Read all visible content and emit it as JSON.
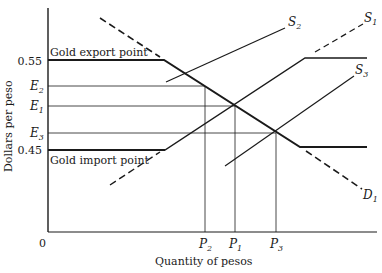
{
  "diagram": {
    "y_axis_label": "Dollars per peso",
    "x_axis_label": "Quantity of pesos",
    "origin_label": "0",
    "y_ticks": [
      {
        "label": "0.55",
        "y": 61
      },
      {
        "label": "E",
        "sub": "2",
        "y": 86
      },
      {
        "label": "E",
        "sub": "1",
        "y": 106
      },
      {
        "label": "E",
        "sub": "3",
        "y": 133
      },
      {
        "label": "0.45",
        "y": 150
      }
    ],
    "x_ticks": [
      {
        "label": "P",
        "sub": "2",
        "x": 205
      },
      {
        "label": "P",
        "sub": "1",
        "x": 235
      },
      {
        "label": "P",
        "sub": "3",
        "x": 276
      }
    ],
    "annotations": {
      "export": "Gold export point",
      "import": "Gold import point"
    },
    "curves": {
      "D1": {
        "label": "D",
        "sub": "1"
      },
      "S1": {
        "label": "S",
        "sub": "1"
      },
      "S2": {
        "label": "S",
        "sub": "2"
      },
      "S3": {
        "label": "S",
        "sub": "3"
      }
    },
    "colors": {
      "ink": "#1a1a1a",
      "background": "#ffffff"
    }
  }
}
